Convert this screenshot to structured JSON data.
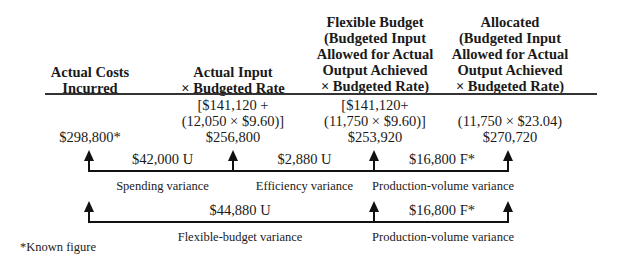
{
  "columns": [
    {
      "header": [
        "Actual Costs",
        "Incurred"
      ],
      "computation": [],
      "amount": "$298,800*"
    },
    {
      "header": [
        "Actual Input",
        "× Budgeted Rate"
      ],
      "computation": [
        "[$141,120 +",
        "(12,050 × $9.60)]"
      ],
      "amount": "$256,800"
    },
    {
      "header": [
        "Flexible Budget",
        "(Budgeted Input",
        "Allowed for Actual",
        "Output Achieved",
        "× Budgeted Rate)"
      ],
      "computation": [
        "[$141,120+",
        "(11,750 × $9.60)]"
      ],
      "amount": "$253,920"
    },
    {
      "header": [
        "Allocated",
        "(Budgeted Input",
        "Allowed for Actual",
        "Output Achieved",
        "× Budgeted Rate)"
      ],
      "computation": [
        "(11,750 × $23.04)"
      ],
      "amount": "$270,720"
    }
  ],
  "variances_level1": [
    {
      "amount": "$42,000 U",
      "label": "Spending variance"
    },
    {
      "amount": "$2,880 U",
      "label": "Efficiency variance"
    },
    {
      "amount": "$16,800 F*",
      "label": "Production-volume variance"
    }
  ],
  "variances_level2": [
    {
      "amount": "$44,880 U",
      "label": "Flexible-budget variance"
    },
    {
      "amount": "$16,800 F*",
      "label": "Production-volume variance"
    }
  ],
  "footnote": "*Known figure"
}
